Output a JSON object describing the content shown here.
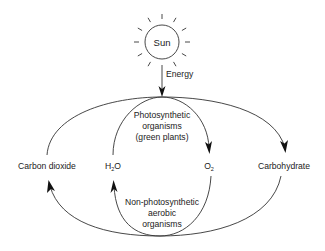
{
  "diagram": {
    "sun": {
      "label": "Sun"
    },
    "energy": {
      "label": "Energy"
    },
    "nodes": {
      "carbon_dioxide": "Carbon dioxide",
      "water": "H",
      "water_sub": "2",
      "water_tail": "O",
      "oxygen": "O",
      "oxygen_sub": "2",
      "carbohydrate": "Carbohydrate"
    },
    "groups": {
      "photosynthetic": [
        "Photosynthetic",
        "organisms",
        "(green plants)"
      ],
      "non_photosynthetic": [
        "Non-photosynthetic",
        "aerobic",
        "organisms"
      ]
    },
    "edges": [
      {
        "from": "Carbon dioxide",
        "to": "Carbohydrate",
        "via": "Photosynthetic organisms"
      },
      {
        "from": "H2O",
        "to": "O2",
        "via": "Photosynthetic organisms"
      },
      {
        "from": "O2",
        "to": "H2O",
        "via": "Non-photosynthetic aerobic organisms"
      },
      {
        "from": "Carbohydrate",
        "to": "Carbon dioxide",
        "via": "Non-photosynthetic aerobic organisms"
      },
      {
        "from": "Sun",
        "to": "Photosynthetic organisms",
        "label": "Energy"
      }
    ],
    "colors": {
      "line": "#333333",
      "text": "#222222",
      "background": "#ffffff"
    }
  }
}
